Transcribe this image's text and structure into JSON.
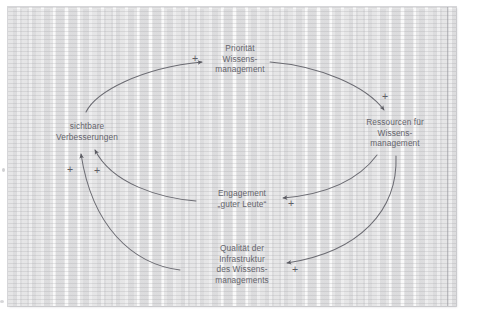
{
  "diagram": {
    "type": "causal-loop-diagram",
    "paper_color": "#f3f3f3",
    "ink_color": "#65656c",
    "nodes": [
      {
        "id": "prioritaet",
        "lines": [
          "Priorität",
          "Wissens-",
          "management"
        ]
      },
      {
        "id": "ressourcen",
        "lines": [
          "Ressourcen für",
          "Wissens-",
          "management"
        ]
      },
      {
        "id": "sichtbare",
        "lines": [
          "sichtbare",
          "Verbesserungen"
        ]
      },
      {
        "id": "engagement",
        "lines": [
          "Engagement",
          "„guter Leute“"
        ]
      },
      {
        "id": "qualitaet",
        "lines": [
          "Qualität der",
          "Infrastruktur",
          "des Wissens-",
          "managements"
        ]
      }
    ],
    "links": [
      {
        "from": "sichtbare",
        "to": "prioritaet",
        "polarity": "+"
      },
      {
        "from": "prioritaet",
        "to": "ressourcen",
        "polarity": "+"
      },
      {
        "from": "ressourcen",
        "to": "engagement",
        "polarity": "+"
      },
      {
        "from": "ressourcen",
        "to": "qualitaet",
        "polarity": "+"
      },
      {
        "from": "engagement",
        "to": "sichtbare",
        "polarity": "+"
      },
      {
        "from": "qualitaet",
        "to": "sichtbare",
        "polarity": "+"
      }
    ],
    "polarity_markers": [
      {
        "id": "plus-to-prioritaet",
        "label": "+"
      },
      {
        "id": "plus-to-ressourcen",
        "label": "+"
      },
      {
        "id": "plus-to-engagement",
        "label": "+"
      },
      {
        "id": "plus-to-qualitaet",
        "label": "+"
      },
      {
        "id": "plus-from-engagement-to-sichtbare",
        "label": "+"
      },
      {
        "id": "plus-from-qualitaet-to-sichtbare",
        "label": "+"
      }
    ]
  }
}
